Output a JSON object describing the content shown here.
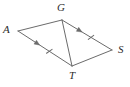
{
  "figure": {
    "name": "quadrilateral-with-diagonal",
    "background_color": "#ffffff",
    "stroke_color": "#6b6b6b",
    "label_color": "#2b2b2b",
    "vertices": [
      {
        "id": "A",
        "label": "A",
        "x": 18,
        "y": 31,
        "label_x": 3,
        "label_y": 24
      },
      {
        "id": "G",
        "label": "G",
        "x": 62,
        "y": 20,
        "label_x": 57,
        "label_y": 2
      },
      {
        "id": "S",
        "label": "S",
        "x": 112,
        "y": 50,
        "label_x": 118,
        "label_y": 44
      },
      {
        "id": "T",
        "label": "T",
        "x": 72,
        "y": 66,
        "label_x": 69,
        "label_y": 70
      }
    ],
    "edges": [
      {
        "id": "AG",
        "from": "A",
        "to": "G",
        "marks": "none"
      },
      {
        "id": "AT",
        "from": "A",
        "to": "T",
        "marks": "arrow-and-tick"
      },
      {
        "id": "GS",
        "from": "G",
        "to": "S",
        "marks": "arrow-and-tick"
      },
      {
        "id": "TS",
        "from": "T",
        "to": "S",
        "marks": "none"
      },
      {
        "id": "GT",
        "from": "G",
        "to": "T",
        "marks": "none"
      }
    ],
    "marks": {
      "arrow_note": "single arrowhead midway along AT and GS indicating parallel segments",
      "tick_note": "single tick hatch on AT and GS indicating congruent segments"
    }
  }
}
